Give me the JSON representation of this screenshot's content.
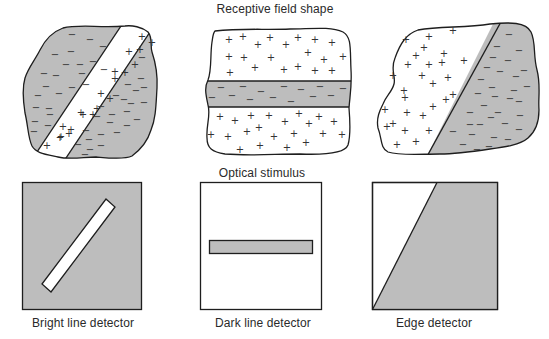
{
  "title_top": "Receptive field shape",
  "title_middle": "Optical stimulus",
  "colors": {
    "gray": "#bdbdbd",
    "white": "#ffffff",
    "stroke": "#1e1e1e"
  },
  "detectors": [
    {
      "label": "Bright line detector"
    },
    {
      "label": "Dark line detector"
    },
    {
      "label": "Edge detector"
    }
  ],
  "symbols": {
    "excitatory": "+",
    "inhibitory": "−"
  },
  "fields": {
    "bright": {
      "plus": [
        [
          142,
          37
        ],
        [
          152,
          43
        ],
        [
          129,
          52
        ],
        [
          140,
          50
        ],
        [
          115,
          72
        ],
        [
          135,
          65
        ],
        [
          115,
          79
        ],
        [
          125,
          73
        ],
        [
          101,
          94
        ],
        [
          110,
          99
        ],
        [
          93,
          115
        ],
        [
          97,
          109
        ],
        [
          83,
          115
        ],
        [
          71,
          130
        ],
        [
          69,
          134
        ],
        [
          61,
          137
        ],
        [
          60,
          138
        ],
        [
          47,
          146
        ],
        [
          63,
          127
        ],
        [
          81,
          113
        ]
      ],
      "minus": [
        [
          72,
          35
        ],
        [
          90,
          40
        ],
        [
          55,
          55
        ],
        [
          71,
          52
        ],
        [
          103,
          47
        ],
        [
          66,
          65
        ],
        [
          93,
          62
        ],
        [
          104,
          70
        ],
        [
          44,
          74
        ],
        [
          56,
          76
        ],
        [
          80,
          65
        ],
        [
          46,
          87
        ],
        [
          82,
          74
        ],
        [
          59,
          94
        ],
        [
          86,
          85
        ],
        [
          38,
          96
        ],
        [
          72,
          88
        ],
        [
          49,
          109
        ],
        [
          36,
          108
        ],
        [
          50,
          115
        ],
        [
          35,
          122
        ],
        [
          48,
          126
        ],
        [
          34,
          132
        ],
        [
          142,
          58
        ],
        [
          141,
          79
        ],
        [
          144,
          88
        ],
        [
          128,
          85
        ],
        [
          136,
          91
        ],
        [
          116,
          96
        ],
        [
          124,
          100
        ],
        [
          101,
          107
        ],
        [
          131,
          104
        ],
        [
          144,
          103
        ],
        [
          112,
          115
        ],
        [
          127,
          112
        ],
        [
          97,
          117
        ],
        [
          137,
          120
        ],
        [
          86,
          131
        ],
        [
          110,
          123
        ],
        [
          127,
          126
        ],
        [
          89,
          140
        ],
        [
          101,
          135
        ],
        [
          117,
          133
        ],
        [
          78,
          145
        ],
        [
          90,
          150
        ],
        [
          101,
          146
        ],
        [
          85,
          155
        ]
      ]
    },
    "dark": {
      "plus": [
        [
          229,
          40
        ],
        [
          243,
          37
        ],
        [
          258,
          45
        ],
        [
          270,
          38
        ],
        [
          286,
          45
        ],
        [
          298,
          38
        ],
        [
          315,
          40
        ],
        [
          332,
          43
        ],
        [
          229,
          57
        ],
        [
          244,
          58
        ],
        [
          271,
          58
        ],
        [
          308,
          53
        ],
        [
          324,
          60
        ],
        [
          343,
          57
        ],
        [
          230,
          73
        ],
        [
          255,
          68
        ],
        [
          284,
          70
        ],
        [
          298,
          67
        ],
        [
          315,
          71
        ],
        [
          332,
          71
        ],
        [
          220,
          117
        ],
        [
          235,
          121
        ],
        [
          251,
          116
        ],
        [
          269,
          116
        ],
        [
          285,
          122
        ],
        [
          299,
          114
        ],
        [
          319,
          117
        ],
        [
          334,
          122
        ],
        [
          211,
          135
        ],
        [
          228,
          137
        ],
        [
          247,
          132
        ],
        [
          259,
          128
        ],
        [
          274,
          137
        ],
        [
          294,
          134
        ],
        [
          309,
          124
        ],
        [
          323,
          134
        ],
        [
          342,
          135
        ],
        [
          240,
          150
        ],
        [
          260,
          146
        ],
        [
          287,
          148
        ],
        [
          306,
          143
        ]
      ],
      "minus": [
        [
          221,
          88
        ],
        [
          243,
          87
        ],
        [
          261,
          92
        ],
        [
          284,
          87
        ],
        [
          301,
          90
        ],
        [
          320,
          87
        ],
        [
          343,
          89
        ],
        [
          212,
          98
        ],
        [
          232,
          96
        ],
        [
          250,
          100
        ],
        [
          273,
          98
        ],
        [
          291,
          102
        ],
        [
          313,
          97
        ],
        [
          331,
          96
        ]
      ]
    },
    "edge": {
      "plus": [
        [
          406,
          40
        ],
        [
          429,
          37
        ],
        [
          453,
          31
        ],
        [
          424,
          48
        ],
        [
          444,
          54
        ],
        [
          416,
          56
        ],
        [
          442,
          63
        ],
        [
          408,
          65
        ],
        [
          464,
          61
        ],
        [
          429,
          65
        ],
        [
          393,
          76
        ],
        [
          422,
          76
        ],
        [
          404,
          91
        ],
        [
          448,
          78
        ],
        [
          433,
          84
        ],
        [
          405,
          98
        ],
        [
          453,
          95
        ],
        [
          407,
          113
        ],
        [
          433,
          107
        ],
        [
          446,
          100
        ],
        [
          393,
          124
        ],
        [
          405,
          131
        ],
        [
          423,
          116
        ],
        [
          385,
          110
        ],
        [
          387,
          127
        ],
        [
          429,
          131
        ],
        [
          416,
          142
        ],
        [
          397,
          145
        ]
      ],
      "minus": [
        [
          509,
          35
        ],
        [
          497,
          47
        ],
        [
          519,
          51
        ],
        [
          493,
          58
        ],
        [
          508,
          61
        ],
        [
          524,
          71
        ],
        [
          487,
          68
        ],
        [
          500,
          72
        ],
        [
          481,
          80
        ],
        [
          516,
          77
        ],
        [
          492,
          88
        ],
        [
          514,
          91
        ],
        [
          478,
          94
        ],
        [
          495,
          97
        ],
        [
          510,
          99
        ],
        [
          527,
          87
        ],
        [
          470,
          113
        ],
        [
          484,
          106
        ],
        [
          498,
          113
        ],
        [
          519,
          102
        ],
        [
          480,
          125
        ],
        [
          491,
          118
        ],
        [
          505,
          124
        ],
        [
          520,
          116
        ],
        [
          470,
          125
        ],
        [
          453,
          132
        ],
        [
          472,
          135
        ],
        [
          494,
          138
        ],
        [
          508,
          140
        ],
        [
          463,
          145
        ],
        [
          477,
          150
        ],
        [
          489,
          147
        ],
        [
          519,
          130
        ]
      ]
    }
  }
}
